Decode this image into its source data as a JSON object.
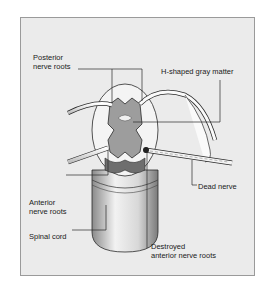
{
  "diagram": {
    "type": "anatomical-illustration",
    "labels": {
      "posterior_line1": "Posterior",
      "posterior_line2": "nerve roots",
      "gray_matter": "H-shaped gray matter",
      "dead_nerve": "Dead nerve",
      "anterior_line1": "Anterior",
      "anterior_line2": "nerve roots",
      "spinal_cord": "Spinal cord",
      "destroyed_line1": "Destroyed",
      "destroyed_line2": "anterior nerve roots"
    },
    "colors": {
      "panel_bg": "#ebebeb",
      "panel_border": "#9a9a9a",
      "gray_matter": "#9d9d9d",
      "white_matter": "#f4f4f4",
      "outline": "#2a2a2a"
    }
  }
}
